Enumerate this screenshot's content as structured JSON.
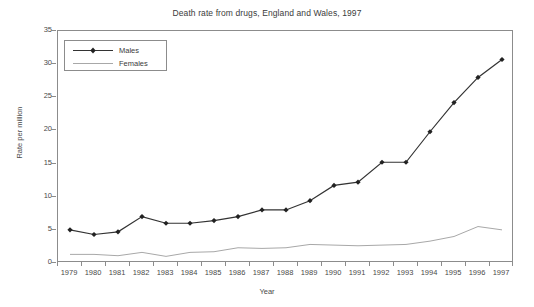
{
  "chart_data": {
    "type": "line",
    "title": "Death rate from drugs, England and Wales, 1997",
    "xlabel": "Year",
    "ylabel": "Rate per million",
    "categories": [
      "1979",
      "1980",
      "1981",
      "1982",
      "1983",
      "1984",
      "1985",
      "1986",
      "1987",
      "1988",
      "1989",
      "1990",
      "1991",
      "1992",
      "1993",
      "1994",
      "1995",
      "1996",
      "1997"
    ],
    "ylim": [
      0,
      35
    ],
    "yticks": [
      0,
      5,
      10,
      15,
      20,
      25,
      30,
      35
    ],
    "grid": false,
    "legend_position": "upper-left inside plot",
    "series": [
      {
        "name": "Males",
        "color": "#333333",
        "marker": "diamond",
        "values": [
          5.0,
          4.3,
          4.7,
          7.0,
          6.0,
          6.0,
          6.4,
          7.0,
          8.0,
          8.0,
          9.4,
          11.7,
          12.2,
          15.2,
          15.2,
          19.8,
          24.2,
          28.0,
          30.7
        ]
      },
      {
        "name": "Females",
        "color": "#a8a8a8",
        "marker": "none",
        "values": [
          1.3,
          1.3,
          1.1,
          1.6,
          1.0,
          1.6,
          1.7,
          2.3,
          2.2,
          2.3,
          2.8,
          2.7,
          2.6,
          2.7,
          2.8,
          3.3,
          4.0,
          5.5,
          5.0
        ]
      }
    ]
  },
  "legend": {
    "items": [
      {
        "label": "Males"
      },
      {
        "label": "Females"
      }
    ]
  }
}
